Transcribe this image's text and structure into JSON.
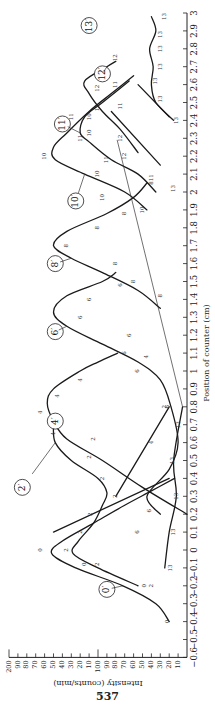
{
  "page_number": "537",
  "chart_data": {
    "type": "line",
    "orientation": "rotated 90 degrees (page printed sideways)",
    "title": "",
    "xlabel": "Position of counter (cm)",
    "ylabel": "Intensity (counts/min)",
    "xlim": [
      -0.6,
      3.0
    ],
    "ylim": [
      0,
      200
    ],
    "x_ticks": [
      -0.6,
      -0.5,
      -0.4,
      -0.3,
      -0.2,
      -0.1,
      0,
      0.1,
      0.2,
      0.3,
      0.4,
      0.5,
      0.6,
      0.7,
      0.8,
      0.9,
      1,
      1.1,
      1.2,
      1.3,
      1.4,
      1.5,
      1.6,
      1.7,
      1.8,
      1.9,
      2,
      2.1,
      2.2,
      2.3,
      2.4,
      2.5,
      2.6,
      2.7,
      2.8,
      2.9,
      3
    ],
    "x_tick_labels": [
      "−0.6",
      "−0.5",
      "−0.4",
      "−0.3",
      "−0.2",
      "−0.1",
      "0",
      "0.1",
      "0.2",
      "0.3",
      "0.4",
      "0.5",
      "0.6",
      "0.7",
      "0.8",
      "0.9",
      "1",
      "1.1",
      "1.2",
      "1.3",
      "1.4",
      "1.5",
      "1.6",
      "1.7",
      "1.8",
      "1.9",
      "2",
      "2.1",
      "2.2",
      "2.3",
      "2.4",
      "2.5",
      "2.6",
      "2.7",
      "2.8",
      "2.9",
      "3"
    ],
    "y_ticks": [
      10,
      20,
      30,
      40,
      50,
      60,
      70,
      80,
      90,
      100,
      110,
      120,
      130,
      140,
      150,
      160,
      170,
      180,
      190,
      200
    ],
    "y_tick_labels": [
      "10",
      "20",
      "30",
      "40",
      "50",
      "60",
      "70",
      "80",
      "90",
      "100",
      "10",
      "20",
      "30",
      "40",
      "50",
      "60",
      "70",
      "80",
      "90",
      "200"
    ],
    "grid": false,
    "legend": "curves labeled with circled numbers",
    "series": [
      {
        "name": "0′",
        "label_pos": [
          -0.22,
          90
        ],
        "points": [
          [
            -0.4,
            20
          ],
          [
            -0.3,
            35
          ],
          [
            -0.2,
            72
          ],
          [
            -0.1,
            125
          ],
          [
            -0.02,
            152
          ],
          [
            0.05,
            140
          ],
          [
            0.15,
            105
          ],
          [
            0.25,
            70
          ],
          [
            0.33,
            40
          ],
          [
            0.4,
            14
          ]
        ],
        "markers": [
          [
            -0.4,
            22,
            "0"
          ],
          [
            -0.2,
            48,
            "0"
          ],
          [
            -0.08,
            115,
            "0"
          ],
          [
            0.0,
            165,
            "0"
          ]
        ]
      },
      {
        "name": "2′",
        "label_pos": [
          0.35,
          185
        ],
        "points": [
          [
            -0.2,
            55
          ],
          [
            -0.1,
            100
          ],
          [
            -0.02,
            128
          ],
          [
            0.05,
            122
          ],
          [
            0.15,
            105
          ],
          [
            0.25,
            95
          ],
          [
            0.32,
            90
          ],
          [
            0.4,
            100
          ],
          [
            0.5,
            130
          ],
          [
            0.6,
            148
          ],
          [
            0.7,
            150
          ]
        ],
        "markers": [
          [
            -0.2,
            40,
            "2"
          ],
          [
            -0.08,
            100,
            "2"
          ],
          [
            0.0,
            135,
            "2"
          ],
          [
            0.1,
            120,
            "2"
          ],
          [
            0.2,
            108,
            "2"
          ],
          [
            0.3,
            80,
            "2"
          ],
          [
            0.4,
            95,
            "2"
          ],
          [
            0.52,
            110,
            "2"
          ],
          [
            0.62,
            105,
            "2"
          ],
          [
            0.8,
            25,
            "2"
          ]
        ]
      },
      {
        "name": "4′",
        "label_pos": [
          0.72,
          148
        ],
        "points": [
          [
            0.2,
            0
          ],
          [
            0.35,
            50
          ],
          [
            0.5,
            95
          ],
          [
            0.62,
            135
          ],
          [
            0.72,
            150
          ],
          [
            0.82,
            157
          ],
          [
            0.9,
            150
          ],
          [
            1.0,
            120
          ],
          [
            1.05,
            100
          ],
          [
            1.1,
            78
          ]
        ],
        "markers": [
          [
            0.65,
            150,
            "4"
          ],
          [
            0.77,
            165,
            "4"
          ],
          [
            0.86,
            145,
            "4"
          ],
          [
            0.95,
            120,
            "4"
          ],
          [
            0.6,
            40,
            "4"
          ],
          [
            1.08,
            45,
            "4"
          ]
        ]
      },
      {
        "name": "6′",
        "label_pos": [
          1.22,
          148
        ],
        "points": [
          [
            0.2,
            30
          ],
          [
            0.3,
            45
          ],
          [
            0.45,
            20
          ],
          [
            0.6,
            10
          ],
          [
            0.8,
            18
          ],
          [
            0.95,
            30
          ],
          [
            1.05,
            55
          ],
          [
            1.15,
            95
          ],
          [
            1.25,
            135
          ],
          [
            1.33,
            150
          ],
          [
            1.42,
            135
          ],
          [
            1.5,
            95
          ],
          [
            1.55,
            80
          ]
        ],
        "markers": [
          [
            0.1,
            55,
            "6"
          ],
          [
            0.22,
            42,
            "6"
          ],
          [
            0.8,
            22,
            "6"
          ],
          [
            1.0,
            55,
            "6"
          ],
          [
            1.1,
            70,
            "6"
          ],
          [
            1.2,
            65,
            "6"
          ],
          [
            1.3,
            120,
            "6"
          ],
          [
            1.4,
            110,
            "6"
          ],
          [
            1.48,
            75,
            "6"
          ]
        ]
      },
      {
        "name": "8′",
        "label_pos": [
          1.6,
          148
        ],
        "points": [
          [
            1.35,
            30
          ],
          [
            1.45,
            55
          ],
          [
            1.55,
            95
          ],
          [
            1.63,
            130
          ],
          [
            1.7,
            150
          ],
          [
            1.78,
            135
          ],
          [
            1.88,
            90
          ],
          [
            1.97,
            60
          ],
          [
            2.05,
            45
          ]
        ],
        "markers": [
          [
            1.42,
            30,
            "8"
          ],
          [
            1.5,
            60,
            "8"
          ],
          [
            1.6,
            80,
            "8"
          ],
          [
            1.7,
            135,
            "8"
          ],
          [
            1.8,
            100,
            "8"
          ],
          [
            1.88,
            70,
            "8"
          ],
          [
            2.05,
            40,
            "8"
          ]
        ]
      },
      {
        "name": "10′",
        "label_pos": [
          1.95,
          125
        ],
        "points": [
          [
            1.9,
            45
          ],
          [
            2.0,
            70
          ],
          [
            2.1,
            115
          ],
          [
            2.18,
            148
          ],
          [
            2.25,
            150
          ],
          [
            2.33,
            135
          ],
          [
            2.45,
            110
          ],
          [
            2.55,
            85
          ],
          [
            2.65,
            60
          ]
        ],
        "markers": [
          [
            1.9,
            50,
            "10"
          ],
          [
            1.97,
            95,
            "10"
          ],
          [
            2.1,
            100,
            "10"
          ],
          [
            2.2,
            160,
            "10"
          ],
          [
            2.33,
            110,
            "10"
          ],
          [
            2.42,
            110,
            "10"
          ]
        ]
      },
      {
        "name": "11′",
        "label_pos": [
          2.38,
          140
        ],
        "points": [
          [
            2.0,
            35
          ],
          [
            2.1,
            55
          ],
          [
            2.18,
            85
          ],
          [
            2.28,
            110
          ],
          [
            2.33,
            120
          ],
          [
            2.42,
            115
          ],
          [
            2.5,
            95
          ],
          [
            2.58,
            75
          ],
          [
            2.62,
            65
          ]
        ],
        "markers": [
          [
            2.08,
            40,
            "11"
          ],
          [
            2.18,
            90,
            "11"
          ],
          [
            2.3,
            120,
            "11"
          ],
          [
            2.42,
            130,
            "11"
          ],
          [
            2.6,
            80,
            "11"
          ],
          [
            2.48,
            75,
            "11"
          ]
        ]
      },
      {
        "name": "12′",
        "label_pos": [
          2.66,
          95
        ],
        "points": [
          [
            2.22,
            55
          ],
          [
            2.35,
            75
          ],
          [
            2.45,
            95
          ],
          [
            2.55,
            110
          ],
          [
            2.62,
            115
          ],
          [
            2.7,
            90
          ],
          [
            2.73,
            80
          ]
        ],
        "markers": [
          [
            2.2,
            70,
            "12"
          ],
          [
            2.3,
            75,
            "12"
          ],
          [
            2.47,
            100,
            "12"
          ],
          [
            2.58,
            100,
            "12"
          ],
          [
            2.75,
            80,
            "12"
          ]
        ]
      },
      {
        "name": "13′",
        "label_pos": [
          2.93,
          110
        ],
        "points": [
          [
            -0.1,
            25
          ],
          [
            0.1,
            20
          ],
          [
            0.3,
            12
          ],
          [
            0.5,
            15
          ],
          [
            0.8,
            5
          ]
        ],
        "markers": [
          [
            -0.1,
            18,
            "13"
          ],
          [
            0.1,
            15,
            "13"
          ],
          [
            0.3,
            12,
            "13"
          ],
          [
            0.5,
            16,
            "13"
          ],
          [
            0.7,
            10,
            "13"
          ]
        ]
      },
      {
        "name": "13′ (right)",
        "label_pos": [
          2.93,
          110
        ],
        "points": [
          [
            2.4,
            15
          ],
          [
            2.5,
            35
          ],
          [
            2.6,
            40
          ],
          [
            2.7,
            38
          ],
          [
            2.8,
            42
          ],
          [
            2.9,
            35
          ],
          [
            2.98,
            40
          ]
        ],
        "markers": [
          [
            2.02,
            15,
            "13"
          ],
          [
            2.4,
            12,
            "13"
          ],
          [
            2.52,
            30,
            "13"
          ],
          [
            2.62,
            35,
            "13"
          ],
          [
            2.7,
            30,
            "13"
          ],
          [
            2.8,
            30,
            "13"
          ],
          [
            2.88,
            30,
            "13"
          ],
          [
            2.98,
            25,
            "13"
          ]
        ]
      }
    ],
    "extra_lines": [
      {
        "name": "line-12",
        "points": [
          [
            2.15,
            30
          ],
          [
            2.45,
            85
          ]
        ]
      },
      {
        "name": "line-10-13",
        "points": [
          [
            2.42,
            20
          ],
          [
            2.6,
            55
          ]
        ]
      },
      {
        "name": "line-2-tail",
        "points": [
          [
            0.1,
            150
          ],
          [
            0.4,
            20
          ]
        ]
      },
      {
        "name": "line-4-tail",
        "points": [
          [
            0.3,
            80
          ],
          [
            0.8,
            20
          ]
        ]
      }
    ]
  }
}
